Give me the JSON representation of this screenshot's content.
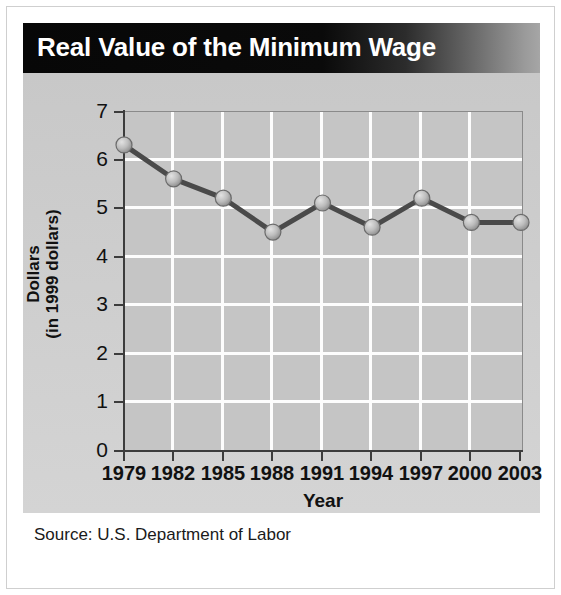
{
  "header": {
    "title": "Real Value of the Minimum Wage"
  },
  "source": {
    "text": "Source: U.S. Department of Labor"
  },
  "colors": {
    "title_bar_dark": "#070707",
    "title_bar_light": "#a6a6a6",
    "panel_background": "#cdcdcd",
    "plot_background": "#c5c5c5",
    "grid_line": "#fdfdfd",
    "axis": "#3c3c3c",
    "series_line": "#4a4a4a",
    "marker_fill": "#b8b8b8",
    "marker_stroke": "#6b6b6b"
  },
  "chart_data": {
    "type": "line",
    "title": "Real Value of the Minimum Wage",
    "xlabel": "Year",
    "ylabel": "Dollars\n(in 1999 dollars)",
    "ylabel_line1": "Dollars",
    "ylabel_line2": "(in 1999 dollars)",
    "categories": [
      "1979",
      "1982",
      "1985",
      "1988",
      "1991",
      "1994",
      "1997",
      "2000",
      "2003"
    ],
    "x": [
      1979,
      1982,
      1985,
      1988,
      1991,
      1994,
      1997,
      2000,
      2003
    ],
    "values": [
      6.3,
      5.6,
      5.2,
      4.5,
      5.1,
      4.6,
      5.2,
      4.7,
      4.7
    ],
    "series": [
      {
        "name": "Real value of the minimum wage",
        "values": [
          6.3,
          5.6,
          5.2,
          4.5,
          5.1,
          4.6,
          5.2,
          4.7,
          4.7
        ]
      }
    ],
    "ylim": [
      0,
      7
    ],
    "yticks": [
      0,
      1,
      2,
      3,
      4,
      5,
      6,
      7
    ],
    "ytick_labels": [
      "0",
      "1",
      "2",
      "3",
      "4",
      "5",
      "6",
      "7"
    ],
    "xtick_labels": [
      "1979",
      "1982",
      "1985",
      "1988",
      "1991",
      "1994",
      "1997",
      "2000",
      "2003"
    ],
    "grid": true,
    "grid_style": "white lines on gray plot background",
    "legend": false,
    "legend_position": "none",
    "markers": "circle",
    "annotations": []
  }
}
